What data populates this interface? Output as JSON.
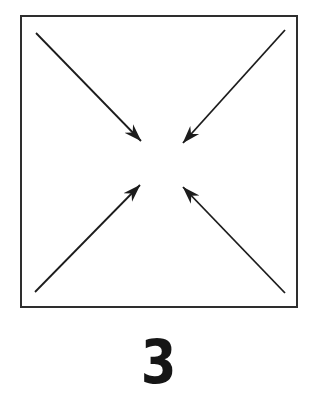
{
  "label": {
    "text": "3"
  },
  "colors": {
    "ink": "#1c1c1c",
    "outline": "#2e2e2e",
    "background": "#ffffff"
  },
  "diagram": {
    "square": {
      "x": 21,
      "y": 16,
      "width": 276,
      "height": 291
    },
    "arrows": [
      {
        "name": "arrow-from-top-left",
        "x1": 36,
        "y1": 33,
        "x2": 141,
        "y2": 141
      },
      {
        "name": "arrow-from-top-right",
        "x1": 285,
        "y1": 30,
        "x2": 183,
        "y2": 143
      },
      {
        "name": "arrow-from-bottom-left",
        "x1": 35,
        "y1": 292,
        "x2": 140,
        "y2": 185
      },
      {
        "name": "arrow-from-bottom-right",
        "x1": 285,
        "y1": 293,
        "x2": 183,
        "y2": 187
      }
    ]
  }
}
